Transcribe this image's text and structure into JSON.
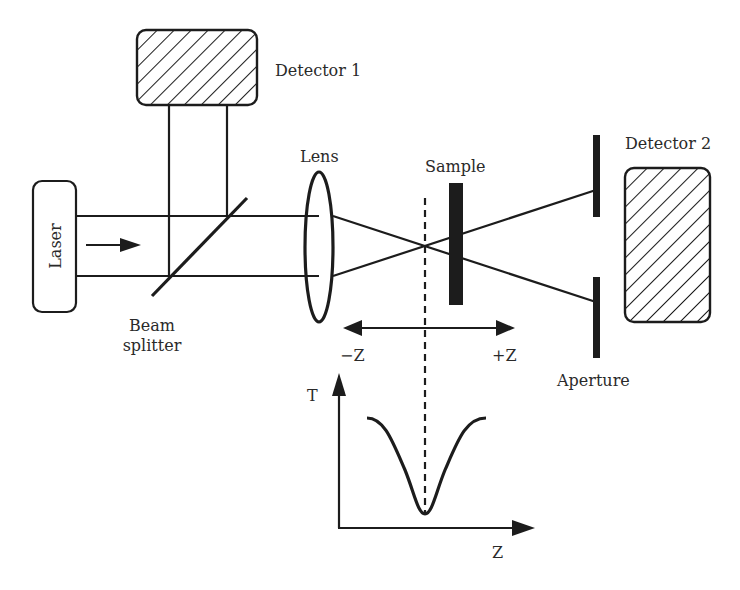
{
  "diagram": {
    "labels": {
      "laser": "Laser",
      "detector1": "Detector 1",
      "detector2": "Detector 2",
      "lens": "Lens",
      "sample": "Sample",
      "beam_splitter_line1": "Beam",
      "beam_splitter_line2": "splitter",
      "aperture": "Aperture",
      "minus_z": "−Z",
      "plus_z": "+Z",
      "plot_y_axis": "T",
      "plot_x_axis": "Z"
    },
    "components": [
      {
        "id": "laser",
        "kind": "source",
        "shape": "rounded-rect"
      },
      {
        "id": "beam-splitter",
        "kind": "optic",
        "shape": "diagonal-line"
      },
      {
        "id": "detector-1",
        "kind": "detector",
        "shape": "hatched-rounded-rect"
      },
      {
        "id": "lens",
        "kind": "optic",
        "shape": "ellipse"
      },
      {
        "id": "sample",
        "kind": "sample",
        "shape": "filled-bar"
      },
      {
        "id": "aperture",
        "kind": "aperture",
        "shape": "split-bar"
      },
      {
        "id": "detector-2",
        "kind": "detector",
        "shape": "hatched-rounded-rect"
      }
    ],
    "connections": [
      {
        "from": "laser",
        "to": "beam-splitter",
        "label": "collimated beam"
      },
      {
        "from": "beam-splitter",
        "to": "detector-1",
        "label": "reference beam"
      },
      {
        "from": "beam-splitter",
        "to": "lens"
      },
      {
        "from": "lens",
        "to": "sample",
        "label": "focused beam"
      },
      {
        "from": "sample",
        "to": "aperture"
      },
      {
        "from": "aperture",
        "to": "detector-2"
      }
    ],
    "inset_plot": {
      "description": "Normalized transmittance T vs sample position Z showing a valley at the focal point",
      "curve_shape": "valley",
      "minimum_at": "focus (Z = 0)"
    },
    "colors": {
      "ink": "#1c1c1c",
      "text": "#2a2a2a",
      "background": "#ffffff"
    }
  }
}
